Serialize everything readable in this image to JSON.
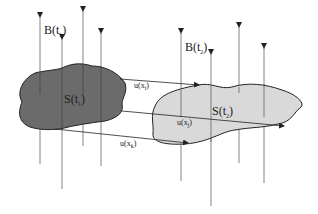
{
  "diagram": {
    "labels": {
      "field_t1": "B(t",
      "field_t1_sub": "1",
      "field_t2": "B(t",
      "field_t2_sub": "2",
      "surface_t1": "S(t",
      "surface_t1_sub": "1",
      "surface_t2": "S(t",
      "surface_t2_sub": "2",
      "velocity_i": "u(x",
      "velocity_i_sub": "i",
      "velocity_j": "u(x",
      "velocity_j_sub": "j",
      "velocity_k": "u(x",
      "velocity_k_sub": "k",
      "close_paren": ")"
    },
    "colors": {
      "surface_t1_fill": "#6b6b6b",
      "surface_t2_fill": "#d9d9d9",
      "line": "#333333",
      "background": "#ffffff"
    },
    "field_lines_t1_count": 4,
    "field_lines_t2_count": 4,
    "velocity_arrows_count": 3
  }
}
